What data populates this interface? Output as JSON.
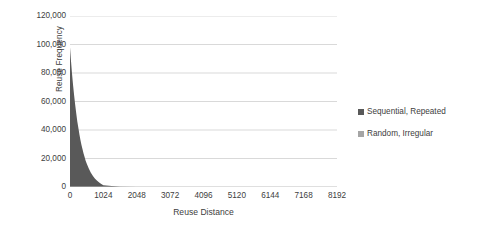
{
  "chart_data": {
    "type": "area",
    "title": "",
    "xlabel": "Reuse Distance",
    "ylabel": "Reuse Frequency",
    "xlim": [
      0,
      8192
    ],
    "ylim": [
      0,
      120000
    ],
    "grid": true,
    "legend_position": "right",
    "x_ticks": [
      "0",
      "1024",
      "2048",
      "3072",
      "4096",
      "5120",
      "6144",
      "7168",
      "8192"
    ],
    "x_tick_values": [
      0,
      1024,
      2048,
      3072,
      4096,
      5120,
      6144,
      7168,
      8192
    ],
    "y_ticks": [
      "0",
      "20,000",
      "40,000",
      "60,000",
      "80,000",
      "100,000",
      "120,000"
    ],
    "y_tick_values": [
      0,
      20000,
      40000,
      60000,
      80000,
      100000,
      120000
    ],
    "series": [
      {
        "name": "Sequential, Repeated",
        "color": "#595959",
        "x": [
          0,
          32,
          64,
          96,
          128,
          160,
          192,
          224,
          256,
          288,
          320,
          352,
          384,
          416,
          448,
          480,
          512,
          576,
          640,
          704,
          768,
          832,
          896,
          960,
          1024,
          1536,
          2048,
          3072,
          4096,
          5120,
          6144,
          7168,
          8192
        ],
        "values": [
          98000,
          88000,
          79000,
          71000,
          64000,
          57500,
          51500,
          46000,
          41500,
          37000,
          33000,
          29500,
          26500,
          23500,
          21000,
          18500,
          16500,
          13000,
          10000,
          7700,
          5800,
          4300,
          3100,
          2100,
          1200,
          200,
          0,
          0,
          0,
          0,
          0,
          0,
          0
        ]
      },
      {
        "name": "Random, Irregular",
        "color": "#a5a5a5",
        "x": [
          0,
          1024,
          2048,
          3072,
          4096,
          5120,
          6144,
          7168,
          8192
        ],
        "values": [
          0,
          0,
          0,
          0,
          0,
          0,
          0,
          0,
          0
        ]
      }
    ],
    "legend": [
      {
        "label": "Sequential, Repeated",
        "color": "#595959",
        "marker": "square"
      },
      {
        "label": "Random, Irregular",
        "color": "#a5a5a5",
        "marker": "square"
      }
    ],
    "colors": {
      "gridline": "#d9d9d9",
      "axis_line": "#bfbfbf",
      "text": "#404040",
      "background": "#ffffff"
    }
  }
}
